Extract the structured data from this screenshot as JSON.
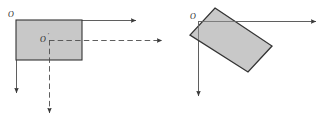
{
  "figure": {
    "title": "",
    "background_color": "#ffffff",
    "width": 333,
    "height": 128
  },
  "style": {
    "body_fill": "#c8c8c8",
    "body_stroke": "#333333",
    "axis_color": "#4d4d4d",
    "dashed_color": "#4d4d4d",
    "label_color": "#1a1a1a"
  },
  "panels": [
    {
      "id": "left-panel",
      "name": "unrotated-body-diagram",
      "origin_label": "O",
      "center_label": "O",
      "center_label_prime": "′",
      "body": {
        "shape": "rectangle",
        "x": 16,
        "y": 20,
        "width": 66,
        "height": 40,
        "rotation_deg": 0
      },
      "axes": [
        {
          "name": "origin-x-axis",
          "style": "solid",
          "from": [
            16,
            20
          ],
          "to": [
            140,
            20
          ],
          "arrow": true
        },
        {
          "name": "origin-y-axis",
          "style": "solid",
          "from": [
            16,
            20
          ],
          "to": [
            16,
            97
          ],
          "arrow": true
        },
        {
          "name": "center-x-axis",
          "style": "dashed",
          "from": [
            49,
            40
          ],
          "to": [
            166,
            40
          ],
          "arrow": true
        },
        {
          "name": "center-y-axis",
          "style": "dashed",
          "from": [
            49,
            40
          ],
          "to": [
            49,
            117
          ],
          "arrow": true
        }
      ]
    },
    {
      "id": "right-panel",
      "name": "rotated-body-diagram",
      "origin_label": "O",
      "body": {
        "shape": "rectangle",
        "corners": [
          [
            215,
            8
          ],
          [
            272,
            46
          ],
          [
            248,
            72
          ],
          [
            190,
            35
          ]
        ],
        "rotation_deg": -33
      },
      "axes": [
        {
          "name": "origin-x-axis",
          "style": "solid",
          "from": [
            198,
            21
          ],
          "to": [
            320,
            21
          ],
          "arrow": true
        },
        {
          "name": "origin-y-axis",
          "style": "solid",
          "from": [
            198,
            21
          ],
          "to": [
            198,
            100
          ],
          "arrow": true
        }
      ]
    }
  ]
}
